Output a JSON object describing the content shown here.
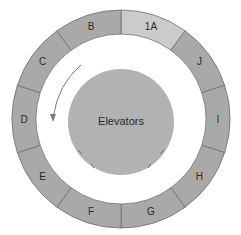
{
  "diagram": {
    "center_label": "Elevators",
    "direction": "counter-clockwise",
    "segments": [
      {
        "label": "1A",
        "highlight": true
      },
      {
        "label": "J",
        "highlight": false
      },
      {
        "label": "I",
        "highlight": false
      },
      {
        "label": "H",
        "highlight": false
      },
      {
        "label": "G",
        "highlight": false
      },
      {
        "label": "F",
        "highlight": false
      },
      {
        "label": "E",
        "highlight": false
      },
      {
        "label": "D",
        "highlight": false
      },
      {
        "label": "C",
        "highlight": false
      },
      {
        "label": "B",
        "highlight": false
      }
    ],
    "colors": {
      "segment": "#a9a9a9",
      "segment_highlight": "#cbcbcb",
      "core": "#b2b2b2",
      "stroke": "#6e6e6e",
      "arrow": "#7a7a7a"
    }
  }
}
